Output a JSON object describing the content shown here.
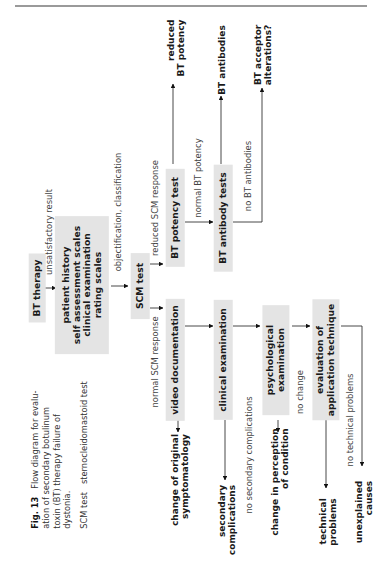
{
  "caption": {
    "fig_label": "Fig. 13",
    "text_line1": "Flow diagram for evalu-",
    "text_line2": "ation of secondary botulinum",
    "text_line3": "toxin (BT) therapy failure of",
    "text_line4": "dystonia.",
    "abbrev_term": "SCM test",
    "abbrev_def": "sternocleidomastoid test"
  },
  "nodes": {
    "bt_therapy": "BT therapy",
    "assessment": [
      "patient history",
      "self assessment scales",
      "clinical examination",
      "rating scales"
    ],
    "scm_test": "SCM test",
    "bt_potency_test": "BT potency test",
    "bt_antibody_tests": "BT antibody tests",
    "video_documentation": "video documentation",
    "clinical_examination": "clinical examination",
    "psychological_examination": [
      "psychological",
      "examination"
    ],
    "evaluation_technique": [
      "evaluation of",
      "application technique"
    ]
  },
  "edges": {
    "unsatisfactory_result": "unsatisfactory result",
    "objectification": "objectification, classification",
    "reduced_scm": "reduced SCM response",
    "normal_scm": "normal SCM response",
    "normal_bt_potency": "normal BT potency",
    "no_bt_antibodies": "no BT antibodies",
    "no_secondary_complications": "no secondary complications",
    "no_change": "no change",
    "no_technical_problems": "no technical problems"
  },
  "outcomes": {
    "reduced_bt_potency": [
      "reduced",
      "BT potency"
    ],
    "bt_antibodies": "BT antibodies",
    "bt_acceptor": [
      "BT acceptor",
      "alterations?"
    ],
    "change_symptomatology": [
      "change of original",
      "symptomatology"
    ],
    "secondary_complications": [
      "secondary",
      "complications"
    ],
    "change_perception": [
      "change in perception",
      "of condition"
    ],
    "technical_problems": [
      "technical",
      "problems"
    ],
    "unexplained_causes": [
      "unexplained",
      "causes"
    ]
  }
}
